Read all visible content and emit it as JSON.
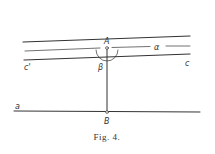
{
  "figure": {
    "caption": "Fig. 4.",
    "labels": {
      "A": "A",
      "B": "B",
      "alpha": "α",
      "beta": "β",
      "c": "c",
      "c_prime": "c'",
      "a": "a"
    }
  }
}
